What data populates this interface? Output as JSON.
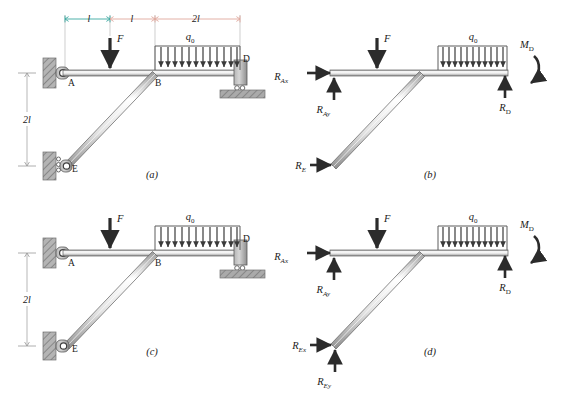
{
  "figure": {
    "background_color": "#ffffff",
    "ink_color": "#333333",
    "member_fill": "#d8d8d8",
    "member_stroke": "#4a4a4a",
    "hatch_color": "#8c8c8c",
    "ground_fill": "#a8a8a8",
    "dim_teal": "#3aa8a0",
    "dim_salmon": "#e0a79c",
    "arrow_color": "#2b2b2b"
  },
  "panels": [
    {
      "id": "a",
      "label": "(a)",
      "caption_x": 152,
      "caption_y": 178,
      "show_top_dimensions": true,
      "show_vertical_dimension": true,
      "support_E_type": "roller-on-wall",
      "support_A_type": "pin-on-wall",
      "support_D_type": "roller-on-ground",
      "point_labels": [
        {
          "name": "A",
          "text": "A",
          "x": 68,
          "y": 86
        },
        {
          "name": "B",
          "text": "B",
          "x": 155,
          "y": 86
        },
        {
          "name": "D",
          "text": "D",
          "x": 243,
          "y": 62
        },
        {
          "name": "E",
          "text": "E",
          "x": 72,
          "y": 172
        }
      ],
      "load_labels": [
        {
          "name": "force-F",
          "text": "F",
          "x": 117,
          "y": 42
        },
        {
          "name": "distributed-load-q0",
          "base": "q",
          "sub": "0",
          "x": 190,
          "y": 40
        }
      ],
      "dimensions": {
        "top": [
          {
            "name": "dim-l-1",
            "text": "l",
            "x": 89,
            "y": 22,
            "color": "#3aa8a0"
          },
          {
            "name": "dim-l-2",
            "text": "l",
            "x": 132,
            "y": 22,
            "color": "#e0a79c"
          },
          {
            "name": "dim-2l",
            "text": "2l",
            "x": 196,
            "y": 22,
            "color": "#e0a79c"
          }
        ],
        "vertical": {
          "name": "dim-2l-vertical",
          "text": "2l",
          "x": 22,
          "y": 123
        }
      }
    },
    {
      "id": "b",
      "label": "(b)",
      "caption_x": 430,
      "caption_y": 178,
      "show_top_dimensions": false,
      "show_vertical_dimension": false,
      "point_labels": [],
      "load_labels": [
        {
          "name": "force-F",
          "text": "F",
          "x": 400,
          "y": 42
        },
        {
          "name": "distributed-load-q0",
          "base": "q",
          "sub": "0",
          "x": 473,
          "y": 40
        }
      ],
      "reactions": [
        {
          "name": "reaction-RAx",
          "base": "R",
          "sub": "Ax",
          "x": 292,
          "y": 80,
          "type": "arrow-right"
        },
        {
          "name": "reaction-RAy",
          "base": "R",
          "sub": "Ay",
          "x": 304,
          "y": 108,
          "type": "arrow-up"
        },
        {
          "name": "reaction-RE",
          "base": "R",
          "sub": "E",
          "x": 292,
          "y": 165,
          "type": "arrow-right"
        },
        {
          "name": "reaction-RD",
          "base": "R",
          "sub": "D",
          "x": 506,
          "y": 105,
          "type": "arrow-up"
        },
        {
          "name": "moment-MD",
          "base": "M",
          "sub": "D",
          "x": 528,
          "y": 47,
          "type": "moment-curved"
        }
      ]
    },
    {
      "id": "c",
      "label": "(c)",
      "caption_x": 152,
      "caption_y": 355,
      "show_top_dimensions": false,
      "show_vertical_dimension": true,
      "support_E_type": "pin-on-wall",
      "support_A_type": "pin-on-wall",
      "support_D_type": "roller-on-ground",
      "point_labels": [
        {
          "name": "A",
          "text": "A",
          "x": 68,
          "y": 266
        },
        {
          "name": "B",
          "text": "B",
          "x": 155,
          "y": 266
        },
        {
          "name": "D",
          "text": "D",
          "x": 243,
          "y": 242
        },
        {
          "name": "E",
          "text": "E",
          "x": 72,
          "y": 352
        }
      ],
      "load_labels": [
        {
          "name": "force-F",
          "text": "F",
          "x": 117,
          "y": 222
        },
        {
          "name": "distributed-load-q0",
          "base": "q",
          "sub": "0",
          "x": 190,
          "y": 220
        }
      ],
      "dimensions": {
        "vertical": {
          "name": "dim-2l-vertical",
          "text": "2l",
          "x": 22,
          "y": 303
        }
      }
    },
    {
      "id": "d",
      "label": "(d)",
      "caption_x": 430,
      "caption_y": 355,
      "show_top_dimensions": false,
      "show_vertical_dimension": false,
      "load_labels": [
        {
          "name": "force-F",
          "text": "F",
          "x": 400,
          "y": 222
        },
        {
          "name": "distributed-load-q0",
          "base": "q",
          "sub": "0",
          "x": 473,
          "y": 220
        }
      ],
      "reactions": [
        {
          "name": "reaction-RAx",
          "base": "R",
          "sub": "Ax",
          "x": 292,
          "y": 260,
          "type": "arrow-right"
        },
        {
          "name": "reaction-RAy",
          "base": "R",
          "sub": "Ay",
          "x": 304,
          "y": 288,
          "type": "arrow-up"
        },
        {
          "name": "reaction-REx",
          "base": "R",
          "sub": "Ex",
          "x": 292,
          "y": 345,
          "type": "arrow-right"
        },
        {
          "name": "reaction-REy",
          "base": "R",
          "sub": "Ey",
          "x": 304,
          "y": 380,
          "type": "arrow-up"
        },
        {
          "name": "reaction-RD",
          "base": "R",
          "sub": "D",
          "x": 506,
          "y": 285,
          "type": "arrow-up"
        },
        {
          "name": "moment-MD",
          "base": "M",
          "sub": "D",
          "x": 528,
          "y": 227,
          "type": "moment-curved"
        }
      ]
    }
  ],
  "geometry": {
    "distributed_load_arrow_count": 13,
    "beam_y_top": 73,
    "point_A_x": 65,
    "point_B_x": 155,
    "point_D_x": 240,
    "point_E_x": 65,
    "point_E_y": 166
  }
}
